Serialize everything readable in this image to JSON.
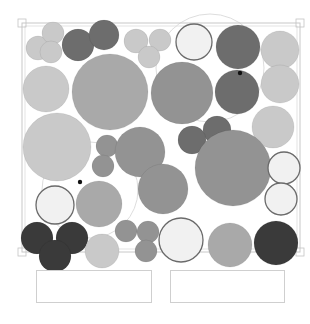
{
  "diagram": {
    "type": "planting-plan",
    "canvas": {
      "width": 310,
      "height": 324,
      "background": "#ffffff"
    },
    "frame": {
      "x": 22,
      "y": 23,
      "width": 278,
      "height": 229,
      "stroke": "#c8c8c8"
    },
    "palette": {
      "white": "#f1f1f1",
      "light": "#c9c9c9",
      "mid": "#a9a9a9",
      "midDark": "#939393",
      "dark": "#6d6d6d",
      "black": "#3a3a3a",
      "outline": "#6a6a6a"
    },
    "plants": [
      {
        "id": "p1",
        "cx": 38,
        "cy": 48,
        "r": 12,
        "tone": "light"
      },
      {
        "id": "p2",
        "cx": 53,
        "cy": 33,
        "r": 11,
        "tone": "light"
      },
      {
        "id": "p3",
        "cx": 51,
        "cy": 52,
        "r": 11,
        "tone": "light"
      },
      {
        "id": "p4",
        "cx": 78,
        "cy": 45,
        "r": 16,
        "tone": "dark"
      },
      {
        "id": "p5",
        "cx": 104,
        "cy": 35,
        "r": 15,
        "tone": "dark"
      },
      {
        "id": "p6",
        "cx": 136,
        "cy": 41,
        "r": 12,
        "tone": "light"
      },
      {
        "id": "p7",
        "cx": 160,
        "cy": 40,
        "r": 11,
        "tone": "light"
      },
      {
        "id": "p8",
        "cx": 149,
        "cy": 57,
        "r": 11,
        "tone": "light"
      },
      {
        "id": "p9",
        "cx": 194,
        "cy": 42,
        "r": 18,
        "tone": "white",
        "outlined": true
      },
      {
        "id": "p10",
        "cx": 238,
        "cy": 47,
        "r": 22,
        "tone": "dark"
      },
      {
        "id": "p11",
        "cx": 237,
        "cy": 92,
        "r": 22,
        "tone": "dark"
      },
      {
        "id": "p12",
        "cx": 280,
        "cy": 50,
        "r": 19,
        "tone": "light"
      },
      {
        "id": "p13",
        "cx": 280,
        "cy": 84,
        "r": 19,
        "tone": "light"
      },
      {
        "id": "p14",
        "cx": 46,
        "cy": 89,
        "r": 23,
        "tone": "light"
      },
      {
        "id": "p15",
        "cx": 110,
        "cy": 92,
        "r": 38,
        "tone": "mid"
      },
      {
        "id": "p16",
        "cx": 182,
        "cy": 93,
        "r": 31,
        "tone": "midDark"
      },
      {
        "id": "p17",
        "cx": 273,
        "cy": 127,
        "r": 21,
        "tone": "light"
      },
      {
        "id": "p18",
        "cx": 217,
        "cy": 130,
        "r": 14,
        "tone": "dark"
      },
      {
        "id": "p19",
        "cx": 192,
        "cy": 140,
        "r": 14,
        "tone": "dark"
      },
      {
        "id": "p20",
        "cx": 57,
        "cy": 147,
        "r": 34,
        "tone": "light"
      },
      {
        "id": "p21",
        "cx": 107,
        "cy": 146,
        "r": 11,
        "tone": "midDark"
      },
      {
        "id": "p22",
        "cx": 103,
        "cy": 166,
        "r": 11,
        "tone": "midDark"
      },
      {
        "id": "p23",
        "cx": 140,
        "cy": 152,
        "r": 25,
        "tone": "midDark"
      },
      {
        "id": "p24",
        "cx": 163,
        "cy": 189,
        "r": 25,
        "tone": "midDark"
      },
      {
        "id": "p25",
        "cx": 233,
        "cy": 168,
        "r": 38,
        "tone": "midDark"
      },
      {
        "id": "p26",
        "cx": 284,
        "cy": 168,
        "r": 16,
        "tone": "white",
        "outlined": true
      },
      {
        "id": "p27",
        "cx": 281,
        "cy": 199,
        "r": 16,
        "tone": "white",
        "outlined": true
      },
      {
        "id": "p28",
        "cx": 55,
        "cy": 205,
        "r": 19,
        "tone": "white",
        "outlined": true
      },
      {
        "id": "p29",
        "cx": 99,
        "cy": 204,
        "r": 23,
        "tone": "mid"
      },
      {
        "id": "p30",
        "cx": 37,
        "cy": 238,
        "r": 16,
        "tone": "black"
      },
      {
        "id": "p31",
        "cx": 72,
        "cy": 238,
        "r": 16,
        "tone": "black"
      },
      {
        "id": "p32",
        "cx": 55,
        "cy": 256,
        "r": 16,
        "tone": "black"
      },
      {
        "id": "p33",
        "cx": 102,
        "cy": 251,
        "r": 17,
        "tone": "light"
      },
      {
        "id": "p34",
        "cx": 126,
        "cy": 231,
        "r": 11,
        "tone": "midDark"
      },
      {
        "id": "p35",
        "cx": 148,
        "cy": 232,
        "r": 11,
        "tone": "midDark"
      },
      {
        "id": "p36",
        "cx": 146,
        "cy": 251,
        "r": 11,
        "tone": "midDark"
      },
      {
        "id": "p37",
        "cx": 181,
        "cy": 240,
        "r": 22,
        "tone": "white",
        "outlined": true
      },
      {
        "id": "p38",
        "cx": 230,
        "cy": 245,
        "r": 22,
        "tone": "mid"
      },
      {
        "id": "p39",
        "cx": 276,
        "cy": 243,
        "r": 22,
        "tone": "black"
      }
    ],
    "markers": [
      {
        "id": "m1",
        "cx": 240,
        "cy": 73,
        "r": 2.2,
        "color": "#111111"
      },
      {
        "id": "m2",
        "cx": 80,
        "cy": 182,
        "r": 2.2,
        "color": "#111111"
      }
    ],
    "outline_arcs": [
      {
        "id": "a1",
        "cx": 210,
        "cy": 68,
        "r": 54,
        "stroke": "#d4d4d4"
      },
      {
        "id": "a2",
        "cx": 90,
        "cy": 190,
        "r": 48,
        "stroke": "#d4d4d4"
      }
    ],
    "label_boxes": [
      {
        "id": "left-label",
        "x": 36,
        "y": 270,
        "width": 116,
        "height": 33,
        "text": ""
      },
      {
        "id": "right-label",
        "x": 170,
        "y": 270,
        "width": 115,
        "height": 33,
        "text": ""
      }
    ]
  }
}
